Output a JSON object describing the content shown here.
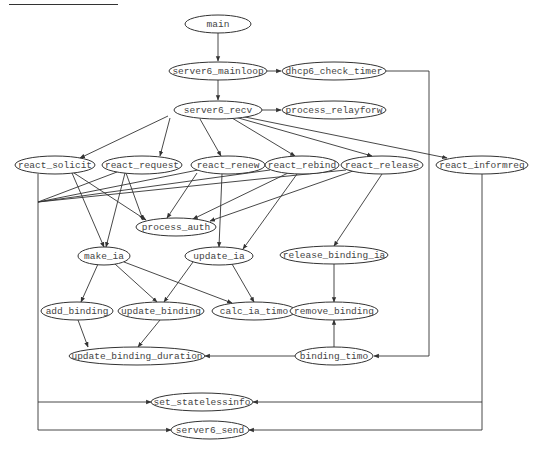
{
  "diagram": {
    "type": "call-graph",
    "nodes": [
      {
        "id": "main",
        "label": "main",
        "cx": 218,
        "cy": 24,
        "rx": 33,
        "ry": 9
      },
      {
        "id": "server6_mainloop",
        "label": "server6_mainloop",
        "cx": 218,
        "cy": 71,
        "rx": 49,
        "ry": 9
      },
      {
        "id": "dhcp6_check_timer",
        "label": "dhcp6_check_timer",
        "cx": 334,
        "cy": 71,
        "rx": 52,
        "ry": 9
      },
      {
        "id": "server6_recv",
        "label": "server6_recv",
        "cx": 218,
        "cy": 110,
        "rx": 44,
        "ry": 9
      },
      {
        "id": "process_relayforw",
        "label": "process_relayforw",
        "cx": 334,
        "cy": 110,
        "rx": 52,
        "ry": 9
      },
      {
        "id": "react_solicit",
        "label": "react_solicit",
        "cx": 55,
        "cy": 165,
        "rx": 40,
        "ry": 9
      },
      {
        "id": "react_request",
        "label": "react_request",
        "cx": 142,
        "cy": 165,
        "rx": 40,
        "ry": 9
      },
      {
        "id": "react_renew",
        "label": "react_renew",
        "cx": 228,
        "cy": 165,
        "rx": 37,
        "ry": 9
      },
      {
        "id": "react_rebind",
        "label": "react_rebind",
        "cx": 302,
        "cy": 165,
        "rx": 37,
        "ry": 9
      },
      {
        "id": "react_release",
        "label": "react_release",
        "cx": 382,
        "cy": 165,
        "rx": 41,
        "ry": 9
      },
      {
        "id": "react_informreq",
        "label": "react_informreq",
        "cx": 482,
        "cy": 165,
        "rx": 46,
        "ry": 9
      },
      {
        "id": "process_auth",
        "label": "process_auth",
        "cx": 176,
        "cy": 227,
        "rx": 40,
        "ry": 9
      },
      {
        "id": "make_ia",
        "label": "make_ia",
        "cx": 104,
        "cy": 256,
        "rx": 26,
        "ry": 9
      },
      {
        "id": "update_ia",
        "label": "update_ia",
        "cx": 219,
        "cy": 256,
        "rx": 34,
        "ry": 9
      },
      {
        "id": "release_binding_ia",
        "label": "release_binding_ia",
        "cx": 334,
        "cy": 255,
        "rx": 54,
        "ry": 9
      },
      {
        "id": "add_binding",
        "label": "add_binding",
        "cx": 77,
        "cy": 311,
        "rx": 36,
        "ry": 9
      },
      {
        "id": "update_binding",
        "label": "update_binding",
        "cx": 161,
        "cy": 311,
        "rx": 43,
        "ry": 9
      },
      {
        "id": "calc_ia_timo",
        "label": "calc_ia_timo",
        "cx": 254,
        "cy": 311,
        "rx": 42,
        "ry": 9
      },
      {
        "id": "remove_binding",
        "label": "remove_binding",
        "cx": 334,
        "cy": 311,
        "rx": 44,
        "ry": 9
      },
      {
        "id": "update_binding_duration",
        "label": "update_binding_duration",
        "cx": 137,
        "cy": 356,
        "rx": 68,
        "ry": 9
      },
      {
        "id": "binding_timo",
        "label": "binding_timo",
        "cx": 334,
        "cy": 356,
        "rx": 39,
        "ry": 9
      },
      {
        "id": "set_statelessinfo",
        "label": "set_statelessinfo",
        "cx": 202,
        "cy": 402,
        "rx": 51,
        "ry": 9
      },
      {
        "id": "server6_send",
        "label": "server6_send",
        "cx": 210,
        "cy": 430,
        "rx": 39,
        "ry": 9
      }
    ],
    "edges": [
      {
        "from": "main",
        "to": "server6_mainloop",
        "d": "M218,33 L218,61"
      },
      {
        "from": "server6_mainloop",
        "to": "dhcp6_check_timer",
        "d": "M267,71 L281,71"
      },
      {
        "from": "server6_mainloop",
        "to": "server6_recv",
        "d": "M218,80 L218,100"
      },
      {
        "from": "server6_recv",
        "to": "process_relayforw",
        "d": "M262,110 L281,110"
      },
      {
        "from": "server6_recv",
        "to": "react_solicit",
        "d": "M168,116 L80,158"
      },
      {
        "from": "server6_recv",
        "to": "react_request",
        "d": "M170,118 L160,156"
      },
      {
        "from": "server6_recv",
        "to": "react_renew",
        "d": "M200,119 L221,156"
      },
      {
        "from": "server6_recv",
        "to": "react_rebind",
        "d": "M232,118 L295,156"
      },
      {
        "from": "server6_recv",
        "to": "react_release",
        "d": "M235,117 L372,156"
      },
      {
        "from": "server6_recv",
        "to": "react_informreq",
        "d": "M240,116 L447,158"
      },
      {
        "from": "dhcp6_check_timer",
        "to": "binding_timo",
        "d": "M386,71 L429,71 L429,356 L374,356"
      },
      {
        "from": "react_solicit",
        "to": "process_auth",
        "d": "M74,173 L146,220"
      },
      {
        "from": "react_solicit",
        "to": "make_ia",
        "d": "M72,173 L104,247"
      },
      {
        "from": "react_request",
        "to": "process_auth",
        "d": "M126,173 L143,220"
      },
      {
        "from": "react_request",
        "to": "make_ia",
        "d": "M125,173 L106,247"
      },
      {
        "from": "react_renew",
        "to": "process_auth",
        "d": "M197,173 L167,218"
      },
      {
        "from": "react_renew",
        "to": "update_ia",
        "d": "M222,174 L219,247"
      },
      {
        "from": "react_rebind",
        "to": "process_auth",
        "d": "M288,173 L193,219"
      },
      {
        "from": "react_rebind",
        "to": "update_ia",
        "d": "M297,174 L243,249"
      },
      {
        "from": "react_release",
        "to": "process_auth",
        "d": "M353,171 L210,221"
      },
      {
        "from": "react_release",
        "to": "release_binding_ia",
        "d": "M382,174 L334,246"
      },
      {
        "from": "react_solicit",
        "to": "junction",
        "d": "M38,174 L38,202"
      },
      {
        "from": "react_request",
        "to": "junction",
        "d": "M117,172 L38,202"
      },
      {
        "from": "react_renew",
        "to": "junction",
        "d": "M198,170 L38,202"
      },
      {
        "from": "react_rebind",
        "to": "junction",
        "d": "M270,170 L38,202"
      },
      {
        "from": "react_release",
        "to": "junction",
        "d": "M346,170 L38,202"
      },
      {
        "from": "junction",
        "to": "set_statelessinfo",
        "d": "M38,202 L38,402 L151,402"
      },
      {
        "from": "junction",
        "to": "server6_send",
        "d": "M38,402 L38,430 L171,430"
      },
      {
        "from": "react_informreq",
        "to": "set_statelessinfo",
        "d": "M482,174 L482,402 L253,402"
      },
      {
        "from": "react_informreq",
        "to": "server6_send",
        "d": "M482,402 L482,430 L249,430"
      },
      {
        "from": "make_ia",
        "to": "add_binding",
        "d": "M98,264 L81,302"
      },
      {
        "from": "make_ia",
        "to": "update_binding",
        "d": "M115,264 L157,302"
      },
      {
        "from": "make_ia",
        "to": "calc_ia_timo",
        "d": "M124,262 L232,303"
      },
      {
        "from": "update_ia",
        "to": "update_binding",
        "d": "M193,262 L164,302"
      },
      {
        "from": "update_ia",
        "to": "calc_ia_timo",
        "d": "M232,264 L254,302"
      },
      {
        "from": "release_binding_ia",
        "to": "remove_binding",
        "d": "M334,264 L334,302"
      },
      {
        "from": "binding_timo",
        "to": "remove_binding",
        "d": "M334,347 L334,320"
      },
      {
        "from": "add_binding",
        "to": "update_binding_duration",
        "d": "M78,320 L88,347"
      },
      {
        "from": "update_binding",
        "to": "update_binding_duration",
        "d": "M160,320 L138,347"
      },
      {
        "from": "binding_timo",
        "to": "update_binding_duration",
        "d": "M295,356 L205,356"
      }
    ]
  }
}
